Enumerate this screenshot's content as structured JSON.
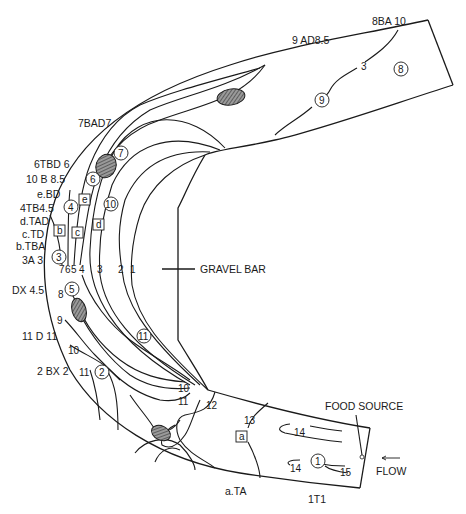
{
  "diagram": {
    "feature_labels": {
      "gravel_bar": "GRAVEL BAR",
      "food_source": "FOOD SOURCE",
      "flow": "FLOW",
      "flow_arrow": "←"
    },
    "territory_labels": [
      {
        "id": "8BA10",
        "text": "8BA 10"
      },
      {
        "id": "9AD85",
        "text": "9 AD8.5"
      },
      {
        "id": "7BAD7",
        "text": "7BAD7"
      },
      {
        "id": "6TBD6",
        "text": "6TBD 6"
      },
      {
        "id": "10B85",
        "text": "10 B 8.5"
      },
      {
        "id": "eBD",
        "text": "e.BD"
      },
      {
        "id": "4TB45",
        "text": "4TB4.5"
      },
      {
        "id": "dTAD",
        "text": "d.TAD"
      },
      {
        "id": "cTD",
        "text": "c.TD"
      },
      {
        "id": "bTBA",
        "text": "b.TBA"
      },
      {
        "id": "3A3",
        "text": "3A 3"
      },
      {
        "id": "DX45",
        "text": "DX 4.5"
      },
      {
        "id": "11D11",
        "text": "11 D 11"
      },
      {
        "id": "2BX2",
        "text": "2 BX 2"
      },
      {
        "id": "aTA",
        "text": "a.TA"
      },
      {
        "id": "1T1",
        "text": "1T1"
      }
    ],
    "contour_labels": {
      "c1": "1",
      "c2": "2",
      "c3": "3",
      "c4": "4",
      "c5": "5",
      "c6": "6",
      "c7": "7",
      "c8": "8",
      "c9": "9",
      "c10a": "10",
      "c11a": "11",
      "c10b": "10",
      "c11b": "11",
      "c12": "12",
      "c13": "13",
      "c14a": "14",
      "c14b": "14",
      "c15": "15",
      "c3_upper": "3"
    },
    "circled_markers": {
      "m1": "1",
      "m2": "2",
      "m3": "3",
      "m4": "4",
      "m5": "5",
      "m6": "6",
      "m7": "7",
      "m8": "8",
      "m9": "9",
      "m10": "10",
      "m11": "11"
    },
    "boxed_markers": {
      "a": "a",
      "b": "b",
      "c": "c",
      "d": "d",
      "e": "e"
    },
    "colors": {
      "line": "#1a1a1a",
      "background": "#ffffff",
      "hatch": "#555555"
    }
  }
}
